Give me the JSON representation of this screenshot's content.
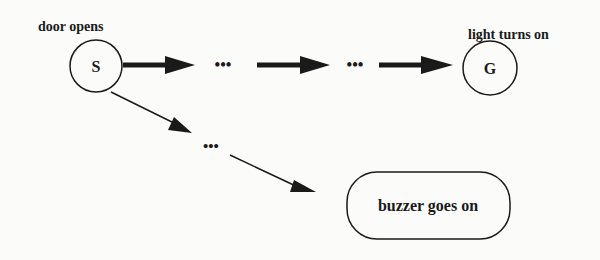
{
  "diagram": {
    "nodes": {
      "start": {
        "id": "S",
        "label": "S",
        "caption": "door opens"
      },
      "goal": {
        "id": "G",
        "label": "G",
        "caption": "light turns on"
      },
      "buzzer": {
        "label": "buzzer goes on"
      }
    },
    "ellipsis": {
      "top_1": "•••",
      "top_2": "•••",
      "branch": "•••"
    },
    "colors": {
      "stroke": "#1a1a1a",
      "background": "#fbfbfa"
    }
  }
}
